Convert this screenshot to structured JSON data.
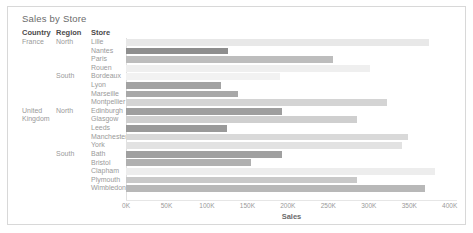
{
  "title": "Sales by Store",
  "columns": {
    "country": "Country",
    "region": "Region",
    "store": "Store"
  },
  "axis": {
    "label": "Sales",
    "ticks": [
      "0K",
      "50K",
      "100K",
      "150K",
      "200K",
      "250K",
      "300K",
      "350K",
      "400K"
    ],
    "tick_values": [
      0,
      50000,
      100000,
      150000,
      200000,
      250000,
      300000,
      350000,
      400000
    ],
    "min": 0,
    "max": 409000
  },
  "chart_data": {
    "type": "bar",
    "orientation": "horizontal",
    "title": "Sales by Store",
    "xlabel": "Sales",
    "ylabel": "",
    "xlim": [
      0,
      409000
    ],
    "grid": false,
    "legend": "none",
    "color_encoding": "grayscale-by-sales",
    "categories": [
      "Lille",
      "Nantes",
      "Paris",
      "Rouen",
      "Bordeaux",
      "Lyon",
      "Marseille",
      "Montpellier",
      "Edinburgh",
      "Glasgow",
      "Leeds",
      "Manchester",
      "York",
      "Bath",
      "Bristol",
      "Clapham",
      "Plymouth",
      "Wimbledon"
    ],
    "values": [
      375000,
      126000,
      256000,
      301000,
      190000,
      118000,
      138000,
      322000,
      193000,
      286000,
      125000,
      348000,
      341000,
      193000,
      155000,
      382000,
      286000,
      370000
    ],
    "colors": [
      "#e8e8e8",
      "#8e8e8e",
      "#bdbdbd",
      "#efefef",
      "#f2f2f2",
      "#a3a3a3",
      "#a8a8a8",
      "#d4d4d4",
      "#9e9e9e",
      "#cfcfcf",
      "#9a9a9a",
      "#d9d9d9",
      "#e2e2e2",
      "#a0a0a0",
      "#b0b0b0",
      "#ededed",
      "#c9c9c9",
      "#b8b8b8"
    ]
  },
  "rows": [
    {
      "country": "France",
      "region": "North",
      "store": "Lille",
      "value": 375000,
      "color": "#e8e8e8"
    },
    {
      "country": "",
      "region": "",
      "store": "Nantes",
      "value": 126000,
      "color": "#8e8e8e"
    },
    {
      "country": "",
      "region": "",
      "store": "Paris",
      "value": 256000,
      "color": "#bdbdbd"
    },
    {
      "country": "",
      "region": "",
      "store": "Rouen",
      "value": 301000,
      "color": "#efefef"
    },
    {
      "country": "",
      "region": "South",
      "store": "Bordeaux",
      "value": 190000,
      "color": "#f2f2f2"
    },
    {
      "country": "",
      "region": "",
      "store": "Lyon",
      "value": 118000,
      "color": "#a3a3a3"
    },
    {
      "country": "",
      "region": "",
      "store": "Marseille",
      "value": 138000,
      "color": "#a8a8a8"
    },
    {
      "country": "",
      "region": "",
      "store": "Montpellier",
      "value": 322000,
      "color": "#d4d4d4"
    },
    {
      "country": "United",
      "region": "North",
      "store": "Edinburgh",
      "value": 193000,
      "color": "#9e9e9e"
    },
    {
      "country": "Kingdom",
      "region": "",
      "store": "Glasgow",
      "value": 286000,
      "color": "#cfcfcf"
    },
    {
      "country": "",
      "region": "",
      "store": "Leeds",
      "value": 125000,
      "color": "#9a9a9a"
    },
    {
      "country": "",
      "region": "",
      "store": "Manchester",
      "value": 348000,
      "color": "#d9d9d9"
    },
    {
      "country": "",
      "region": "",
      "store": "York",
      "value": 341000,
      "color": "#e2e2e2"
    },
    {
      "country": "",
      "region": "South",
      "store": "Bath",
      "value": 193000,
      "color": "#a0a0a0"
    },
    {
      "country": "",
      "region": "",
      "store": "Bristol",
      "value": 155000,
      "color": "#b0b0b0"
    },
    {
      "country": "",
      "region": "",
      "store": "Clapham",
      "value": 382000,
      "color": "#ededed"
    },
    {
      "country": "",
      "region": "",
      "store": "Plymouth",
      "value": 286000,
      "color": "#c9c9c9"
    },
    {
      "country": "",
      "region": "",
      "store": "Wimbledon",
      "value": 370000,
      "color": "#b8b8b8"
    }
  ]
}
